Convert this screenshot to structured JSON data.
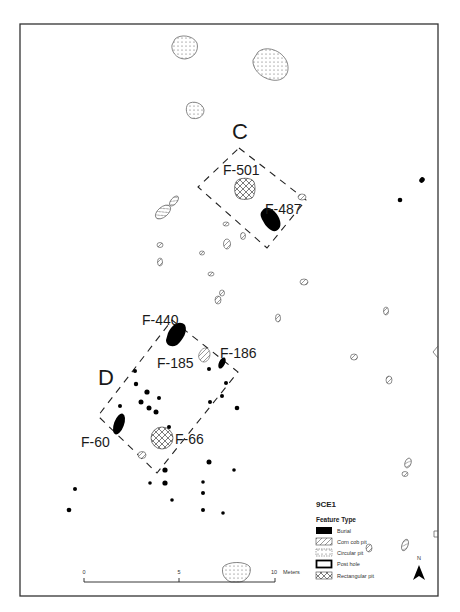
{
  "map": {
    "site_id": "9CE1",
    "areas": [
      {
        "label": "C"
      },
      {
        "label": "D"
      }
    ],
    "feature_labels": [
      {
        "id": "F-501"
      },
      {
        "id": "F-487"
      },
      {
        "id": "F-440"
      },
      {
        "id": "F-185"
      },
      {
        "id": "F-186"
      },
      {
        "id": "F-60"
      },
      {
        "id": "F-66"
      }
    ]
  },
  "legend": {
    "title": "9CE1",
    "subtitle": "Feature Type",
    "items": [
      {
        "label": "Burial",
        "symbol": "solid-black"
      },
      {
        "label": "Corn cob pit",
        "symbol": "diagonal-hatch"
      },
      {
        "label": "Circular pit",
        "symbol": "dot-stipple"
      },
      {
        "label": "Post hole",
        "symbol": "thick-outline"
      },
      {
        "label": "Rectangular pit",
        "symbol": "cross-hatch"
      }
    ]
  },
  "scale_bar": {
    "ticks": [
      "0",
      "5",
      "10"
    ],
    "unit": "Meters"
  },
  "north_arrow": {
    "label": "N"
  },
  "colors": {
    "ink": "#111111",
    "frame": "#333333",
    "background": "#ffffff"
  }
}
